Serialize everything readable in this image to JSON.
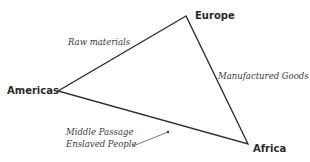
{
  "diagram": {
    "nodes": [
      {
        "id": "europe",
        "label": "Europe"
      },
      {
        "id": "americas",
        "label": "Americas"
      },
      {
        "id": "africa",
        "label": "Africa"
      }
    ],
    "edges": [
      {
        "from": "americas",
        "to": "europe",
        "label": "Raw materials"
      },
      {
        "from": "europe",
        "to": "africa",
        "label": "Manufactured Goods"
      },
      {
        "from": "africa",
        "to": "americas",
        "label_line1": "Middle Passage",
        "label_line2": "Enslaved People"
      }
    ],
    "colors": {
      "line": "#2a2a2a",
      "pointer": "#555555",
      "background": "#ffffff"
    }
  }
}
